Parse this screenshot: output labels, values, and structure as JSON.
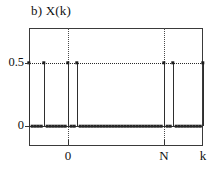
{
  "figure": {
    "title": "b) X(k)",
    "panel_letter": "b)",
    "signal_name": "X(k)"
  },
  "chart_data": {
    "type": "line",
    "plot_style": "stem",
    "title": "b) X(k)",
    "xlabel": "k",
    "ylabel": "X(k)",
    "x_tick_labels": [
      "0",
      "N"
    ],
    "x_tick_positions": [
      0,
      32
    ],
    "y_tick_labels": [
      "0",
      "0.5"
    ],
    "y_tick_values": [
      0,
      0.5
    ],
    "ylim": [
      0,
      0.72
    ],
    "xlim": [
      -13,
      45
    ],
    "grid": "dotted",
    "gridlines_vertical": [
      0,
      32
    ],
    "gridlines_horizontal": [
      0.5
    ],
    "legend": "none",
    "axis_label_k": "k",
    "axis_label_N": "N",
    "axis_label_zero": "0",
    "axis_label_half": "0.5",
    "impulse_value": 0.5,
    "baseline_value": 0,
    "x": [
      -13,
      -12,
      -11,
      -10,
      -9,
      -8,
      -7,
      -6,
      -5,
      -4,
      -3,
      -2,
      -1,
      0,
      1,
      2,
      3,
      4,
      5,
      6,
      7,
      8,
      9,
      10,
      11,
      12,
      13,
      14,
      15,
      16,
      17,
      18,
      19,
      20,
      21,
      22,
      23,
      24,
      25,
      26,
      27,
      28,
      29,
      30,
      31,
      32,
      33,
      34,
      35,
      36,
      37,
      38,
      39,
      40,
      41,
      42,
      43,
      44,
      45
    ],
    "values": [
      0.5,
      0,
      0,
      0,
      0,
      0.5,
      0,
      0,
      0,
      0,
      0,
      0,
      0,
      0.5,
      0,
      0,
      0.5,
      0,
      0,
      0,
      0,
      0,
      0,
      0,
      0,
      0,
      0,
      0,
      0,
      0,
      0,
      0,
      0,
      0,
      0,
      0,
      0,
      0,
      0,
      0,
      0,
      0,
      0,
      0,
      0,
      0.5,
      0,
      0,
      0.5,
      0,
      0,
      0,
      0,
      0,
      0,
      0,
      0,
      0,
      0.5
    ],
    "impulse_x": [
      -13,
      -8,
      0,
      3,
      32,
      35,
      45
    ],
    "series": [
      {
        "name": "X(k)",
        "values": [
          0.5,
          0,
          0,
          0,
          0,
          0.5,
          0,
          0,
          0,
          0,
          0,
          0,
          0,
          0.5,
          0,
          0,
          0.5,
          0,
          0,
          0,
          0,
          0,
          0,
          0,
          0,
          0,
          0,
          0,
          0,
          0,
          0,
          0,
          0,
          0,
          0,
          0,
          0,
          0,
          0,
          0,
          0,
          0,
          0,
          0,
          0,
          0.5,
          0,
          0,
          0.5,
          0,
          0,
          0,
          0,
          0,
          0,
          0,
          0,
          0,
          0.5
        ]
      }
    ]
  }
}
